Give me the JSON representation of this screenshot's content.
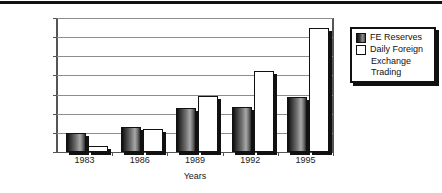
{
  "chart_data": {
    "type": "bar",
    "title": "",
    "xlabel": "Years",
    "ylabel": "U.S. Dollars",
    "categories": [
      "1983",
      "1986",
      "1989",
      "1992",
      "1995"
    ],
    "ylim": [
      0,
      1400
    ],
    "ytick_values": [
      0,
      200,
      400,
      600,
      800,
      1000,
      1200,
      1400
    ],
    "ytick_labels": [
      "0",
      "200",
      "400",
      "600",
      "800",
      "1000",
      "1200",
      "1400"
    ],
    "grid": true,
    "legend_position": "right",
    "series": [
      {
        "name": "FE Reserves",
        "color": "#4a4a4a",
        "values": [
          200,
          260,
          460,
          470,
          580
        ]
      },
      {
        "name": "Daily Foreign Exchange Trading",
        "color": "#ffffff",
        "values": [
          60,
          240,
          590,
          850,
          1300
        ]
      }
    ]
  },
  "legend": {
    "entries": [
      {
        "label": "FE Reserves",
        "swatch": "dark"
      },
      {
        "label": "Daily Foreign",
        "swatch": "light"
      }
    ],
    "continuation": [
      "Exchange",
      "Trading"
    ]
  }
}
